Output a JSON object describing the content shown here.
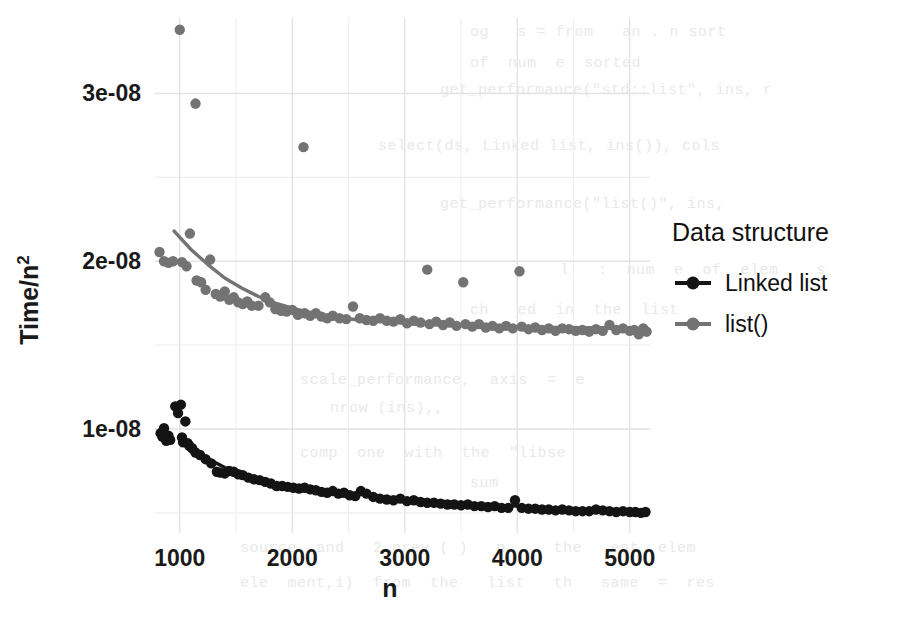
{
  "chart_data": {
    "type": "scatter",
    "title": "",
    "xlabel": "n",
    "ylabel": "Time/n²",
    "ylabel_base": "Time/n",
    "ylabel_exponent": "2",
    "xlim": [
      780,
      5180
    ],
    "ylim": [
      3.8e-09,
      3.45e-08
    ],
    "grid": true,
    "grid_major_color": "#e4e4e4",
    "grid_minor_color": "#f0f0f0",
    "panel_background": "#ffffff",
    "xticks": [
      1000,
      2000,
      3000,
      4000,
      5000
    ],
    "xtick_labels": [
      "1000",
      "2000",
      "3000",
      "4000",
      "5000"
    ],
    "yticks": [
      1e-08,
      2e-08,
      3e-08
    ],
    "ytick_labels": [
      "1e-08",
      "2e-08",
      "3e-08"
    ],
    "legend": {
      "title": "Data structure",
      "position": "right",
      "entries": [
        {
          "label": "Linked list",
          "color": "#141414",
          "key": "point-line"
        },
        {
          "label": "list()",
          "color": "#737373",
          "key": "point-line"
        }
      ]
    },
    "series": [
      {
        "name": "Linked list",
        "color": "#141414",
        "point_radius": 5.2,
        "line_width": 3.4,
        "points": [
          [
            830,
            9.75e-09
          ],
          [
            845,
            9.55e-09
          ],
          [
            860,
            1.005e-08
          ],
          [
            880,
            9.3e-09
          ],
          [
            900,
            9.6e-09
          ],
          [
            915,
            9.35e-09
          ],
          [
            960,
            1.135e-08
          ],
          [
            985,
            1.095e-08
          ],
          [
            1010,
            1.145e-08
          ],
          [
            1020,
            9.5e-09
          ],
          [
            1030,
            9.2e-09
          ],
          [
            1050,
            1.045e-08
          ],
          [
            1070,
            9.15e-09
          ],
          [
            1085,
            9e-09
          ],
          [
            1110,
            8.85e-09
          ],
          [
            1140,
            8.6e-09
          ],
          [
            1180,
            8.45e-09
          ],
          [
            1230,
            8.2e-09
          ],
          [
            1280,
            7.95e-09
          ],
          [
            1330,
            7.45e-09
          ],
          [
            1360,
            7.4e-09
          ],
          [
            1400,
            7.35e-09
          ],
          [
            1440,
            7.5e-09
          ],
          [
            1480,
            7.45e-09
          ],
          [
            1520,
            7.3e-09
          ],
          [
            1560,
            7.25e-09
          ],
          [
            1610,
            7.1e-09
          ],
          [
            1660,
            7e-09
          ],
          [
            1710,
            6.95e-09
          ],
          [
            1760,
            6.85e-09
          ],
          [
            1810,
            6.75e-09
          ],
          [
            1860,
            6.6e-09
          ],
          [
            1910,
            6.6e-09
          ],
          [
            1960,
            6.55e-09
          ],
          [
            2010,
            6.5e-09
          ],
          [
            2060,
            6.45e-09
          ],
          [
            2110,
            6.5e-09
          ],
          [
            2160,
            6.4e-09
          ],
          [
            2210,
            6.35e-09
          ],
          [
            2260,
            6.25e-09
          ],
          [
            2310,
            6.2e-09
          ],
          [
            2360,
            6.3e-09
          ],
          [
            2410,
            6.15e-09
          ],
          [
            2460,
            6.2e-09
          ],
          [
            2510,
            6.05e-09
          ],
          [
            2560,
            6e-09
          ],
          [
            2610,
            6.3e-09
          ],
          [
            2660,
            6.15e-09
          ],
          [
            2720,
            5.95e-09
          ],
          [
            2780,
            5.85e-09
          ],
          [
            2840,
            5.8e-09
          ],
          [
            2900,
            5.75e-09
          ],
          [
            2960,
            5.85e-09
          ],
          [
            3020,
            5.7e-09
          ],
          [
            3080,
            5.75e-09
          ],
          [
            3140,
            5.65e-09
          ],
          [
            3200,
            5.6e-09
          ],
          [
            3260,
            5.6e-09
          ],
          [
            3320,
            5.55e-09
          ],
          [
            3380,
            5.5e-09
          ],
          [
            3440,
            5.5e-09
          ],
          [
            3500,
            5.45e-09
          ],
          [
            3560,
            5.5e-09
          ],
          [
            3620,
            5.4e-09
          ],
          [
            3680,
            5.4e-09
          ],
          [
            3740,
            5.35e-09
          ],
          [
            3800,
            5.4e-09
          ],
          [
            3860,
            5.3e-09
          ],
          [
            3920,
            5.3e-09
          ],
          [
            3980,
            5.75e-09
          ],
          [
            4040,
            5.3e-09
          ],
          [
            4100,
            5.25e-09
          ],
          [
            4160,
            5.25e-09
          ],
          [
            4220,
            5.2e-09
          ],
          [
            4280,
            5.2e-09
          ],
          [
            4340,
            5.15e-09
          ],
          [
            4400,
            5.2e-09
          ],
          [
            4460,
            5.15e-09
          ],
          [
            4520,
            5.1e-09
          ],
          [
            4580,
            5.1e-09
          ],
          [
            4640,
            5.1e-09
          ],
          [
            4700,
            5.2e-09
          ],
          [
            4760,
            5.15e-09
          ],
          [
            4820,
            5.1e-09
          ],
          [
            4880,
            5.05e-09
          ],
          [
            4940,
            5.1e-09
          ],
          [
            5000,
            5.05e-09
          ],
          [
            5050,
            5.05e-09
          ],
          [
            5100,
            5e-09
          ],
          [
            5140,
            5.05e-09
          ]
        ],
        "fit": [
          [
            1000,
            9.35e-09
          ],
          [
            1200,
            8.4e-09
          ],
          [
            1400,
            7.7e-09
          ],
          [
            1600,
            7.2e-09
          ],
          [
            1800,
            6.85e-09
          ],
          [
            2000,
            6.6e-09
          ],
          [
            2200,
            6.4e-09
          ],
          [
            2400,
            6.25e-09
          ],
          [
            2600,
            6.1e-09
          ],
          [
            2800,
            5.95e-09
          ],
          [
            3000,
            5.85e-09
          ],
          [
            3200,
            5.75e-09
          ],
          [
            3400,
            5.65e-09
          ],
          [
            3600,
            5.55e-09
          ],
          [
            3800,
            5.45e-09
          ],
          [
            4000,
            5.4e-09
          ],
          [
            4200,
            5.3e-09
          ],
          [
            4400,
            5.25e-09
          ],
          [
            4600,
            5.2e-09
          ],
          [
            4800,
            5.15e-09
          ],
          [
            5000,
            5.1e-09
          ],
          [
            5140,
            5.05e-09
          ]
        ]
      },
      {
        "name": "list()",
        "color": "#737373",
        "point_radius": 5.2,
        "line_width": 3.4,
        "points": [
          [
            820,
            2.055e-08
          ],
          [
            860,
            2e-08
          ],
          [
            900,
            1.99e-08
          ],
          [
            940,
            2e-08
          ],
          [
            1000,
            3.38e-08
          ],
          [
            1020,
            1.995e-08
          ],
          [
            1060,
            1.97e-08
          ],
          [
            1090,
            2.165e-08
          ],
          [
            1140,
            2.94e-08
          ],
          [
            1150,
            1.885e-08
          ],
          [
            1190,
            1.875e-08
          ],
          [
            1230,
            1.83e-08
          ],
          [
            1270,
            2.01e-08
          ],
          [
            1320,
            1.805e-08
          ],
          [
            1360,
            1.79e-08
          ],
          [
            1400,
            1.82e-08
          ],
          [
            1440,
            1.77e-08
          ],
          [
            1480,
            1.785e-08
          ],
          [
            1520,
            1.755e-08
          ],
          [
            1560,
            1.745e-08
          ],
          [
            1600,
            1.76e-08
          ],
          [
            1640,
            1.735e-08
          ],
          [
            1700,
            1.735e-08
          ],
          [
            1760,
            1.785e-08
          ],
          [
            1800,
            1.755e-08
          ],
          [
            1850,
            1.715e-08
          ],
          [
            1900,
            1.705e-08
          ],
          [
            1950,
            1.7e-08
          ],
          [
            2000,
            1.71e-08
          ],
          [
            2050,
            1.68e-08
          ],
          [
            2100,
            2.68e-08
          ],
          [
            2110,
            1.69e-08
          ],
          [
            2160,
            1.675e-08
          ],
          [
            2210,
            1.69e-08
          ],
          [
            2260,
            1.67e-08
          ],
          [
            2310,
            1.66e-08
          ],
          [
            2360,
            1.675e-08
          ],
          [
            2420,
            1.66e-08
          ],
          [
            2480,
            1.655e-08
          ],
          [
            2540,
            1.73e-08
          ],
          [
            2600,
            1.66e-08
          ],
          [
            2660,
            1.65e-08
          ],
          [
            2720,
            1.645e-08
          ],
          [
            2780,
            1.66e-08
          ],
          [
            2840,
            1.645e-08
          ],
          [
            2900,
            1.64e-08
          ],
          [
            2960,
            1.655e-08
          ],
          [
            3020,
            1.63e-08
          ],
          [
            3080,
            1.645e-08
          ],
          [
            3140,
            1.635e-08
          ],
          [
            3200,
            1.95e-08
          ],
          [
            3220,
            1.625e-08
          ],
          [
            3280,
            1.64e-08
          ],
          [
            3340,
            1.62e-08
          ],
          [
            3400,
            1.635e-08
          ],
          [
            3460,
            1.615e-08
          ],
          [
            3520,
            1.875e-08
          ],
          [
            3540,
            1.625e-08
          ],
          [
            3600,
            1.61e-08
          ],
          [
            3660,
            1.625e-08
          ],
          [
            3720,
            1.605e-08
          ],
          [
            3780,
            1.615e-08
          ],
          [
            3840,
            1.6e-08
          ],
          [
            3900,
            1.615e-08
          ],
          [
            3960,
            1.6e-08
          ],
          [
            4020,
            1.94e-08
          ],
          [
            4040,
            1.61e-08
          ],
          [
            4100,
            1.595e-08
          ],
          [
            4160,
            1.605e-08
          ],
          [
            4220,
            1.59e-08
          ],
          [
            4280,
            1.6e-08
          ],
          [
            4340,
            1.585e-08
          ],
          [
            4400,
            1.6e-08
          ],
          [
            4460,
            1.595e-08
          ],
          [
            4520,
            1.585e-08
          ],
          [
            4580,
            1.59e-08
          ],
          [
            4640,
            1.58e-08
          ],
          [
            4700,
            1.595e-08
          ],
          [
            4760,
            1.585e-08
          ],
          [
            4820,
            1.62e-08
          ],
          [
            4880,
            1.59e-08
          ],
          [
            4940,
            1.6e-08
          ],
          [
            5000,
            1.585e-08
          ],
          [
            5040,
            1.59e-08
          ],
          [
            5080,
            1.565e-08
          ],
          [
            5120,
            1.6e-08
          ],
          [
            5150,
            1.58e-08
          ]
        ],
        "fit": [
          [
            950,
            2.18e-08
          ],
          [
            1100,
            2.07e-08
          ],
          [
            1250,
            1.98e-08
          ],
          [
            1400,
            1.9e-08
          ],
          [
            1550,
            1.84e-08
          ],
          [
            1700,
            1.79e-08
          ],
          [
            1850,
            1.75e-08
          ],
          [
            2000,
            1.72e-08
          ],
          [
            2150,
            1.695e-08
          ],
          [
            2300,
            1.675e-08
          ],
          [
            2450,
            1.66e-08
          ],
          [
            2600,
            1.65e-08
          ],
          [
            2800,
            1.64e-08
          ],
          [
            3000,
            1.63e-08
          ],
          [
            3200,
            1.625e-08
          ],
          [
            3400,
            1.62e-08
          ],
          [
            3600,
            1.615e-08
          ],
          [
            3800,
            1.61e-08
          ],
          [
            4000,
            1.608e-08
          ],
          [
            4200,
            1.606e-08
          ],
          [
            4400,
            1.605e-08
          ],
          [
            4600,
            1.604e-08
          ],
          [
            4800,
            1.603e-08
          ],
          [
            5000,
            1.6e-08
          ],
          [
            5150,
            1.595e-08
          ]
        ]
      }
    ]
  },
  "ghost_lines": [
    {
      "x": 470,
      "y": 24,
      "text": "og   s = from   an . n sort"
    },
    {
      "x": 470,
      "y": 55,
      "text": "of  num  e  sorted"
    },
    {
      "x": 440,
      "y": 82,
      "text": "get_performance(\"std::list\", ins, r"
    },
    {
      "x": 378,
      "y": 138,
      "text": "select(ds, Linked list, ins()), cols"
    },
    {
      "x": 440,
      "y": 196,
      "text": "get_performance(\"list()\", ins,"
    },
    {
      "x": 560,
      "y": 262,
      "text": "l   :  num  e  of  elem    s"
    },
    {
      "x": 470,
      "y": 302,
      "text": "ch   ed  in  the  list"
    },
    {
      "x": 300,
      "y": 372,
      "text": "scale_performance,  axis  =  e"
    },
    {
      "x": 330,
      "y": 400,
      "text": "nrow (ins),,"
    },
    {
      "x": 300,
      "y": 445,
      "text": "comp  one  with  the  \"libse"
    },
    {
      "x": 470,
      "y": 475,
      "text": "sum"
    },
    {
      "x": 240,
      "y": 540,
      "text": "source  and   2 prev ( )   n     the   ent  elem"
    },
    {
      "x": 240,
      "y": 575,
      "text": "ele  ment,i)  from  the   list   th   same  =  res"
    }
  ]
}
